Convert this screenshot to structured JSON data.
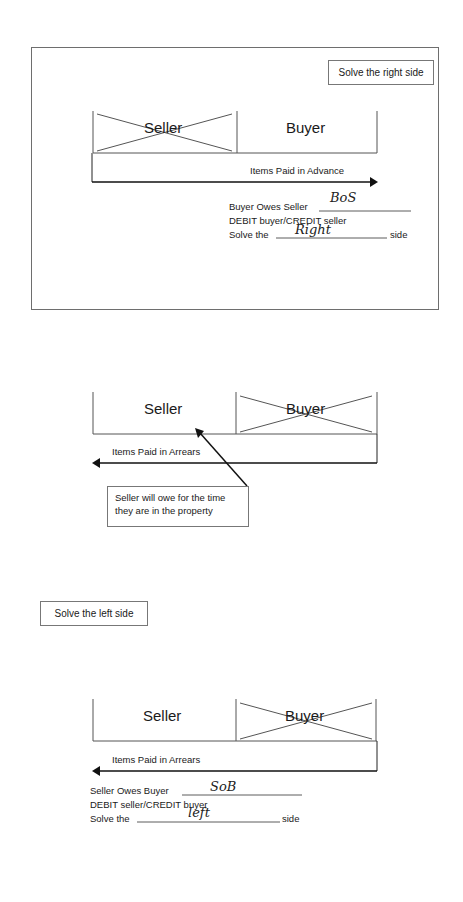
{
  "panels": [
    {
      "id": "advance",
      "label_box": "Solve the right side",
      "columns": {
        "left": "Seller",
        "right": "Buyer"
      },
      "crossed_out": "Seller",
      "arrow_label": "Items Paid in Advance",
      "arrow_direction": "right",
      "lines": {
        "owes": "Buyer Owes Seller",
        "owes_handwritten": "BoS",
        "debit_credit": "DEBIT buyer/CREDIT seller",
        "solve_prefix": "Solve the",
        "solve_handwritten": "Right",
        "solve_suffix": "side"
      }
    },
    {
      "id": "arrears-callout",
      "columns": {
        "left": "Seller",
        "right": "Buyer"
      },
      "crossed_out": "Buyer",
      "arrow_label": "Items Paid in Arrears",
      "arrow_direction": "left",
      "callout": {
        "line1": "Seller will owe for the time",
        "line2": "they are in the property"
      }
    },
    {
      "id": "arrears",
      "label_box": "Solve the left side",
      "columns": {
        "left": "Seller",
        "right": "Buyer"
      },
      "crossed_out": "Buyer",
      "arrow_label": "Items Paid in Arrears",
      "arrow_direction": "left",
      "lines": {
        "owes": "Seller Owes Buyer",
        "owes_handwritten": "SoB",
        "debit_credit": "DEBIT seller/CREDIT buyer",
        "solve_prefix": "Solve the",
        "solve_handwritten": "left",
        "solve_suffix": "side"
      }
    }
  ]
}
